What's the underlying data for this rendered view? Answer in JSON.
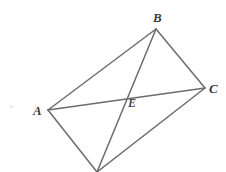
{
  "figure": {
    "type": "geometry-diagram",
    "background_color": "#ffffff",
    "stroke_color": "#6b6b70",
    "stroke_width": 1.5,
    "label_color": "#3a3a3e",
    "canvas": {
      "width": 226,
      "height": 172
    },
    "points": [
      {
        "id": "A",
        "label": "A",
        "x": 48,
        "y": 110,
        "labeled": true
      },
      {
        "id": "B",
        "label": "B",
        "x": 156,
        "y": 29,
        "labeled": true
      },
      {
        "id": "C",
        "label": "C",
        "x": 205,
        "y": 88,
        "labeled": true
      },
      {
        "id": "D",
        "label": "",
        "x": 97,
        "y": 172,
        "labeled": false
      },
      {
        "id": "E",
        "label": "E",
        "x": 124,
        "y": 98,
        "labeled": true
      }
    ],
    "segments": [
      {
        "id": "AB",
        "from": "A",
        "to": "B",
        "kind": "side"
      },
      {
        "id": "BC",
        "from": "B",
        "to": "C",
        "kind": "side"
      },
      {
        "id": "CD",
        "from": "C",
        "to": "D",
        "kind": "side"
      },
      {
        "id": "DA",
        "from": "D",
        "to": "A",
        "kind": "side"
      },
      {
        "id": "AC",
        "from": "A",
        "to": "C",
        "kind": "diagonal"
      },
      {
        "id": "BD",
        "from": "B",
        "to": "D",
        "kind": "diagonal"
      }
    ],
    "labels": {
      "A": "A",
      "B": "B",
      "C": "C",
      "E": "E"
    }
  }
}
